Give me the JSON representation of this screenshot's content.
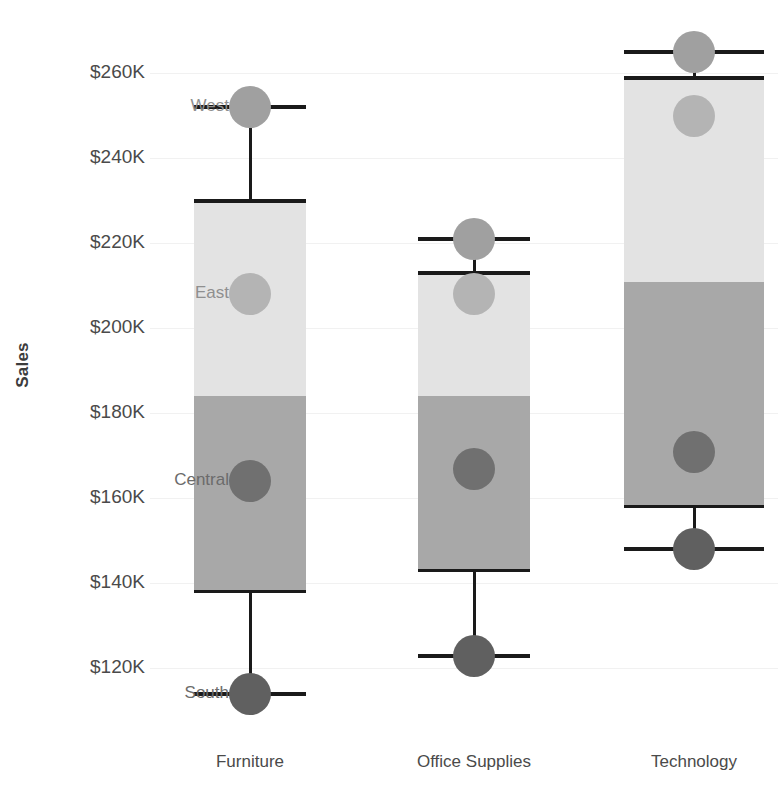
{
  "chart_data": {
    "type": "boxplot",
    "title": "",
    "xlabel": "",
    "ylabel": "Sales",
    "categories": [
      "Furniture",
      "Office Supplies",
      "Technology"
    ],
    "ytick_labels": [
      "$260K",
      "$240K",
      "$220K",
      "$200K",
      "$180K",
      "$160K",
      "$140K",
      "$120K"
    ],
    "ytick_values": [
      260000,
      240000,
      220000,
      200000,
      180000,
      160000,
      140000,
      120000
    ],
    "ylim": [
      108000,
      270000
    ],
    "grid": true,
    "legend_position": "none",
    "value_unit": "USD",
    "boxes": [
      {
        "category": "Furniture",
        "whisker_high": 252000,
        "q3": 230000,
        "median": 184000,
        "q1": 138000,
        "whisker_low": 114000
      },
      {
        "category": "Office Supplies",
        "whisker_high": 221000,
        "q3": 213000,
        "median": 184000,
        "q1": 143000,
        "whisker_low": 123000
      },
      {
        "category": "Technology",
        "whisker_high": 265000,
        "q3": 259000,
        "median": 211000,
        "q1": 158000,
        "whisker_low": 148000
      }
    ],
    "points": [
      {
        "region": "West",
        "category": "Furniture",
        "value": 252000,
        "color": "#a0a0a0",
        "labelled": true
      },
      {
        "region": "East",
        "category": "Furniture",
        "value": 208000,
        "color": "#b4b4b4",
        "labelled": true
      },
      {
        "region": "Central",
        "category": "Furniture",
        "value": 164000,
        "color": "#707070",
        "labelled": true
      },
      {
        "region": "South",
        "category": "Furniture",
        "value": 114000,
        "color": "#606060",
        "labelled": true
      },
      {
        "region": "West",
        "category": "Office Supplies",
        "value": 221000,
        "color": "#a0a0a0",
        "labelled": false
      },
      {
        "region": "East",
        "category": "Office Supplies",
        "value": 208000,
        "color": "#b4b4b4",
        "labelled": false
      },
      {
        "region": "Central",
        "category": "Office Supplies",
        "value": 167000,
        "color": "#707070",
        "labelled": false
      },
      {
        "region": "South",
        "category": "Office Supplies",
        "value": 123000,
        "color": "#606060",
        "labelled": false
      },
      {
        "region": "West",
        "category": "Technology",
        "value": 265000,
        "color": "#a0a0a0",
        "labelled": false
      },
      {
        "region": "East",
        "category": "Technology",
        "value": 250000,
        "color": "#b4b4b4",
        "labelled": false
      },
      {
        "region": "Central",
        "category": "Technology",
        "value": 171000,
        "color": "#707070",
        "labelled": false
      },
      {
        "region": "South",
        "category": "Technology",
        "value": 148000,
        "color": "#606060",
        "labelled": false
      }
    ],
    "colors": {
      "box_upper": "#e3e3e3",
      "box_lower": "#a8a8a8",
      "whisker": "#1a1a1a",
      "tick_text": "#4a4a4a",
      "axis_title": "#3c3c3c",
      "gridline": "#f1f1f1",
      "background": "#ffffff"
    }
  }
}
